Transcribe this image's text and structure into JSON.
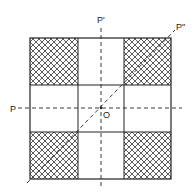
{
  "diagram": {
    "title": "",
    "labels": {
      "axis_horizontal": "P",
      "axis_vertical": "P'",
      "axis_diagonal": "P\"",
      "center": "O"
    },
    "grid": {
      "outer": {
        "x1": 30,
        "y1": 38,
        "x2": 171,
        "y2": 179
      },
      "inner_x": [
        78,
        124
      ],
      "inner_y": [
        85,
        132
      ]
    },
    "hatched_cells": [
      "top-left",
      "top-right",
      "bottom-left",
      "bottom-right"
    ],
    "colors": {
      "line": "#222222",
      "hatch": "#333333",
      "background": "#ffffff"
    }
  }
}
